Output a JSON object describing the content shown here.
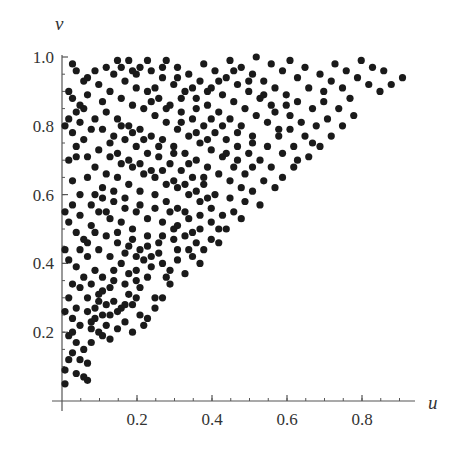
{
  "chart_data": {
    "type": "scatter",
    "title": "",
    "xlabel": "u",
    "ylabel": "v",
    "xlim": [
      0,
      0.95
    ],
    "ylim": [
      0,
      1.0
    ],
    "x_ticks": [
      "0.2",
      "0.4",
      "0.6",
      "0.8"
    ],
    "x_tick_values": [
      0.2,
      0.4,
      0.6,
      0.8
    ],
    "y_ticks": [
      "0.2",
      "0.4",
      "0.6",
      "0.8",
      "1.0"
    ],
    "y_tick_values": [
      0.2,
      0.4,
      0.6,
      0.8,
      1.0
    ],
    "minor_tick_step": 0.05,
    "grid": false,
    "legend": null,
    "marker": {
      "shape": "circle",
      "color": "#1a1a1a",
      "radius_px": 3.6
    },
    "axis_color": "#555555",
    "note": "Points lie in triangular region u <= v <= 1; coordinates estimated from pixels",
    "points": [
      [
        0.02,
        0.98
      ],
      [
        0.03,
        0.96
      ],
      [
        0.01,
        0.9
      ],
      [
        0.02,
        0.88
      ],
      [
        0.05,
        0.93
      ],
      [
        0.04,
        0.86
      ],
      [
        0.05,
        0.85
      ],
      [
        0.03,
        0.84
      ],
      [
        0.06,
        0.94
      ],
      [
        0.01,
        0.82
      ],
      [
        0.02,
        0.78
      ],
      [
        0.0,
        0.8
      ],
      [
        0.05,
        0.76
      ],
      [
        0.03,
        0.71
      ],
      [
        0.01,
        0.7
      ],
      [
        0.02,
        0.64
      ],
      [
        0.0,
        0.55
      ],
      [
        0.02,
        0.57
      ],
      [
        0.04,
        0.54
      ],
      [
        0.01,
        0.52
      ],
      [
        0.03,
        0.49
      ],
      [
        0.05,
        0.47
      ],
      [
        0.0,
        0.44
      ],
      [
        0.01,
        0.41
      ],
      [
        0.03,
        0.39
      ],
      [
        0.05,
        0.36
      ],
      [
        0.02,
        0.34
      ],
      [
        0.04,
        0.33
      ],
      [
        0.01,
        0.3
      ],
      [
        0.03,
        0.27
      ],
      [
        0.0,
        0.26
      ],
      [
        0.02,
        0.24
      ],
      [
        0.04,
        0.22
      ],
      [
        0.01,
        0.19
      ],
      [
        0.03,
        0.17
      ],
      [
        0.02,
        0.14
      ],
      [
        0.01,
        0.12
      ],
      [
        0.0,
        0.09
      ],
      [
        0.03,
        0.08
      ],
      [
        0.0,
        0.05
      ],
      [
        0.05,
        0.07
      ],
      [
        0.06,
        0.06
      ],
      [
        0.06,
        0.11
      ],
      [
        0.05,
        0.15
      ],
      [
        0.07,
        0.17
      ],
      [
        0.09,
        0.2
      ],
      [
        0.07,
        0.23
      ],
      [
        0.1,
        0.25
      ],
      [
        0.08,
        0.27
      ],
      [
        0.06,
        0.3
      ],
      [
        0.09,
        0.31
      ],
      [
        0.07,
        0.34
      ],
      [
        0.1,
        0.36
      ],
      [
        0.12,
        0.33
      ],
      [
        0.13,
        0.29
      ],
      [
        0.15,
        0.27
      ],
      [
        0.11,
        0.22
      ],
      [
        0.14,
        0.21
      ],
      [
        0.12,
        0.18
      ],
      [
        0.16,
        0.23
      ],
      [
        0.18,
        0.2
      ],
      [
        0.2,
        0.25
      ],
      [
        0.22,
        0.24
      ],
      [
        0.18,
        0.28
      ],
      [
        0.17,
        0.31
      ],
      [
        0.2,
        0.33
      ],
      [
        0.24,
        0.3
      ],
      [
        0.22,
        0.36
      ],
      [
        0.19,
        0.38
      ],
      [
        0.15,
        0.4
      ],
      [
        0.12,
        0.42
      ],
      [
        0.09,
        0.44
      ],
      [
        0.06,
        0.46
      ],
      [
        0.08,
        0.49
      ],
      [
        0.11,
        0.48
      ],
      [
        0.14,
        0.46
      ],
      [
        0.17,
        0.45
      ],
      [
        0.2,
        0.44
      ],
      [
        0.23,
        0.42
      ],
      [
        0.26,
        0.4
      ],
      [
        0.28,
        0.38
      ],
      [
        0.25,
        0.46
      ],
      [
        0.22,
        0.48
      ],
      [
        0.18,
        0.5
      ],
      [
        0.15,
        0.52
      ],
      [
        0.12,
        0.53
      ],
      [
        0.09,
        0.55
      ],
      [
        0.07,
        0.57
      ],
      [
        0.1,
        0.59
      ],
      [
        0.13,
        0.58
      ],
      [
        0.16,
        0.56
      ],
      [
        0.19,
        0.55
      ],
      [
        0.22,
        0.53
      ],
      [
        0.26,
        0.52
      ],
      [
        0.29,
        0.5
      ],
      [
        0.32,
        0.48
      ],
      [
        0.35,
        0.46
      ],
      [
        0.3,
        0.44
      ],
      [
        0.34,
        0.42
      ],
      [
        0.37,
        0.44
      ],
      [
        0.39,
        0.47
      ],
      [
        0.36,
        0.5
      ],
      [
        0.33,
        0.53
      ],
      [
        0.3,
        0.56
      ],
      [
        0.27,
        0.58
      ],
      [
        0.24,
        0.6
      ],
      [
        0.2,
        0.61
      ],
      [
        0.17,
        0.63
      ],
      [
        0.14,
        0.65
      ],
      [
        0.11,
        0.66
      ],
      [
        0.08,
        0.68
      ],
      [
        0.06,
        0.71
      ],
      [
        0.09,
        0.73
      ],
      [
        0.12,
        0.71
      ],
      [
        0.15,
        0.69
      ],
      [
        0.18,
        0.68
      ],
      [
        0.21,
        0.66
      ],
      [
        0.24,
        0.65
      ],
      [
        0.27,
        0.63
      ],
      [
        0.3,
        0.62
      ],
      [
        0.33,
        0.6
      ],
      [
        0.36,
        0.58
      ],
      [
        0.39,
        0.56
      ],
      [
        0.42,
        0.54
      ],
      [
        0.4,
        0.6
      ],
      [
        0.37,
        0.63
      ],
      [
        0.34,
        0.65
      ],
      [
        0.31,
        0.67
      ],
      [
        0.28,
        0.69
      ],
      [
        0.25,
        0.71
      ],
      [
        0.22,
        0.72
      ],
      [
        0.19,
        0.74
      ],
      [
        0.16,
        0.76
      ],
      [
        0.13,
        0.77
      ],
      [
        0.1,
        0.79
      ],
      [
        0.08,
        0.82
      ],
      [
        0.11,
        0.84
      ],
      [
        0.14,
        0.82
      ],
      [
        0.17,
        0.8
      ],
      [
        0.2,
        0.79
      ],
      [
        0.23,
        0.77
      ],
      [
        0.26,
        0.76
      ],
      [
        0.29,
        0.74
      ],
      [
        0.32,
        0.72
      ],
      [
        0.35,
        0.7
      ],
      [
        0.38,
        0.68
      ],
      [
        0.41,
        0.66
      ],
      [
        0.44,
        0.64
      ],
      [
        0.47,
        0.62
      ],
      [
        0.45,
        0.68
      ],
      [
        0.42,
        0.71
      ],
      [
        0.39,
        0.73
      ],
      [
        0.36,
        0.75
      ],
      [
        0.33,
        0.77
      ],
      [
        0.3,
        0.79
      ],
      [
        0.27,
        0.81
      ],
      [
        0.24,
        0.83
      ],
      [
        0.21,
        0.85
      ],
      [
        0.18,
        0.86
      ],
      [
        0.15,
        0.88
      ],
      [
        0.12,
        0.9
      ],
      [
        0.09,
        0.92
      ],
      [
        0.13,
        0.95
      ],
      [
        0.16,
        0.93
      ],
      [
        0.19,
        0.91
      ],
      [
        0.22,
        0.9
      ],
      [
        0.25,
        0.88
      ],
      [
        0.28,
        0.86
      ],
      [
        0.31,
        0.84
      ],
      [
        0.34,
        0.82
      ],
      [
        0.37,
        0.8
      ],
      [
        0.4,
        0.78
      ],
      [
        0.43,
        0.76
      ],
      [
        0.46,
        0.74
      ],
      [
        0.49,
        0.72
      ],
      [
        0.52,
        0.7
      ],
      [
        0.5,
        0.77
      ],
      [
        0.47,
        0.8
      ],
      [
        0.44,
        0.82
      ],
      [
        0.41,
        0.84
      ],
      [
        0.38,
        0.86
      ],
      [
        0.35,
        0.88
      ],
      [
        0.32,
        0.9
      ],
      [
        0.29,
        0.92
      ],
      [
        0.26,
        0.94
      ],
      [
        0.23,
        0.96
      ],
      [
        0.2,
        0.97
      ],
      [
        0.17,
        0.99
      ],
      [
        0.14,
        0.99
      ],
      [
        0.27,
        0.99
      ],
      [
        0.3,
        0.97
      ],
      [
        0.33,
        0.95
      ],
      [
        0.36,
        0.93
      ],
      [
        0.39,
        0.91
      ],
      [
        0.42,
        0.89
      ],
      [
        0.45,
        0.87
      ],
      [
        0.48,
        0.85
      ],
      [
        0.51,
        0.83
      ],
      [
        0.54,
        0.81
      ],
      [
        0.57,
        0.79
      ],
      [
        0.55,
        0.86
      ],
      [
        0.52,
        0.88
      ],
      [
        0.49,
        0.9
      ],
      [
        0.46,
        0.92
      ],
      [
        0.43,
        0.94
      ],
      [
        0.4,
        0.96
      ],
      [
        0.37,
        0.98
      ],
      [
        0.44,
        0.99
      ],
      [
        0.47,
        0.97
      ],
      [
        0.5,
        0.95
      ],
      [
        0.53,
        0.93
      ],
      [
        0.56,
        0.91
      ],
      [
        0.59,
        0.89
      ],
      [
        0.62,
        0.87
      ],
      [
        0.6,
        0.83
      ],
      [
        0.63,
        0.81
      ],
      [
        0.66,
        0.85
      ],
      [
        0.69,
        0.87
      ],
      [
        0.65,
        0.91
      ],
      [
        0.62,
        0.94
      ],
      [
        0.58,
        0.96
      ],
      [
        0.55,
        0.98
      ],
      [
        0.51,
        1.0
      ],
      [
        0.6,
        0.99
      ],
      [
        0.64,
        0.97
      ],
      [
        0.68,
        0.95
      ],
      [
        0.71,
        0.93
      ],
      [
        0.74,
        0.91
      ],
      [
        0.72,
        0.98
      ],
      [
        0.75,
        0.96
      ],
      [
        0.78,
        0.94
      ],
      [
        0.81,
        0.92
      ],
      [
        0.84,
        0.9
      ],
      [
        0.87,
        0.92
      ],
      [
        0.9,
        0.94
      ],
      [
        0.82,
        0.97
      ],
      [
        0.79,
        0.99
      ],
      [
        0.85,
        0.96
      ],
      [
        0.76,
        0.88
      ],
      [
        0.73,
        0.85
      ],
      [
        0.7,
        0.82
      ],
      [
        0.67,
        0.8
      ],
      [
        0.64,
        0.77
      ],
      [
        0.61,
        0.74
      ],
      [
        0.58,
        0.72
      ],
      [
        0.55,
        0.68
      ],
      [
        0.53,
        0.64
      ],
      [
        0.5,
        0.61
      ],
      [
        0.48,
        0.58
      ],
      [
        0.45,
        0.55
      ],
      [
        0.43,
        0.5
      ],
      [
        0.41,
        0.46
      ],
      [
        0.44,
        0.59
      ],
      [
        0.48,
        0.66
      ],
      [
        0.58,
        0.65
      ],
      [
        0.61,
        0.68
      ],
      [
        0.65,
        0.71
      ],
      [
        0.68,
        0.74
      ],
      [
        0.71,
        0.77
      ],
      [
        0.74,
        0.8
      ],
      [
        0.77,
        0.83
      ],
      [
        0.69,
        0.9
      ],
      [
        0.66,
        0.75
      ],
      [
        0.62,
        0.7
      ],
      [
        0.56,
        0.62
      ],
      [
        0.52,
        0.57
      ],
      [
        0.47,
        0.53
      ],
      [
        0.41,
        0.5
      ],
      [
        0.36,
        0.4
      ],
      [
        0.32,
        0.37
      ],
      [
        0.28,
        0.34
      ],
      [
        0.26,
        0.3
      ],
      [
        0.24,
        0.27
      ],
      [
        0.21,
        0.22
      ],
      [
        0.33,
        0.44
      ],
      [
        0.29,
        0.47
      ],
      [
        0.25,
        0.43
      ],
      [
        0.21,
        0.41
      ],
      [
        0.17,
        0.37
      ],
      [
        0.13,
        0.35
      ],
      [
        0.1,
        0.32
      ],
      [
        0.08,
        0.38
      ],
      [
        0.06,
        0.42
      ],
      [
        0.04,
        0.44
      ],
      [
        0.07,
        0.51
      ],
      [
        0.04,
        0.6
      ],
      [
        0.06,
        0.65
      ],
      [
        0.03,
        0.74
      ],
      [
        0.07,
        0.79
      ],
      [
        0.04,
        0.81
      ],
      [
        0.1,
        0.87
      ],
      [
        0.06,
        0.89
      ],
      [
        0.08,
        0.96
      ],
      [
        0.11,
        0.97
      ],
      [
        0.19,
        0.95
      ],
      [
        0.24,
        0.91
      ],
      [
        0.31,
        0.88
      ],
      [
        0.35,
        0.85
      ],
      [
        0.39,
        0.82
      ],
      [
        0.42,
        0.8
      ],
      [
        0.46,
        0.78
      ],
      [
        0.5,
        0.75
      ],
      [
        0.54,
        0.74
      ],
      [
        0.57,
        0.77
      ],
      [
        0.6,
        0.79
      ],
      [
        0.56,
        0.84
      ],
      [
        0.59,
        0.86
      ],
      [
        0.53,
        0.89
      ],
      [
        0.49,
        0.93
      ],
      [
        0.45,
        0.96
      ],
      [
        0.41,
        0.93
      ],
      [
        0.38,
        0.9
      ],
      [
        0.34,
        0.91
      ],
      [
        0.3,
        0.94
      ],
      [
        0.26,
        0.97
      ],
      [
        0.22,
        0.99
      ],
      [
        0.18,
        0.96
      ],
      [
        0.15,
        0.97
      ],
      [
        0.23,
        0.87
      ],
      [
        0.27,
        0.85
      ],
      [
        0.31,
        0.81
      ],
      [
        0.35,
        0.78
      ],
      [
        0.38,
        0.76
      ],
      [
        0.43,
        0.72
      ],
      [
        0.46,
        0.7
      ],
      [
        0.5,
        0.68
      ],
      [
        0.37,
        0.65
      ],
      [
        0.33,
        0.69
      ],
      [
        0.29,
        0.72
      ],
      [
        0.25,
        0.74
      ],
      [
        0.21,
        0.76
      ],
      [
        0.18,
        0.78
      ],
      [
        0.15,
        0.8
      ],
      [
        0.12,
        0.75
      ],
      [
        0.14,
        0.72
      ],
      [
        0.17,
        0.7
      ],
      [
        0.2,
        0.69
      ],
      [
        0.23,
        0.67
      ],
      [
        0.26,
        0.67
      ],
      [
        0.29,
        0.64
      ],
      [
        0.32,
        0.63
      ],
      [
        0.35,
        0.61
      ],
      [
        0.38,
        0.59
      ],
      [
        0.39,
        0.52
      ],
      [
        0.36,
        0.54
      ],
      [
        0.32,
        0.55
      ],
      [
        0.28,
        0.55
      ],
      [
        0.24,
        0.56
      ],
      [
        0.2,
        0.57
      ],
      [
        0.16,
        0.59
      ],
      [
        0.13,
        0.61
      ],
      [
        0.1,
        0.62
      ],
      [
        0.08,
        0.6
      ],
      [
        0.11,
        0.55
      ],
      [
        0.14,
        0.49
      ],
      [
        0.18,
        0.47
      ],
      [
        0.22,
        0.45
      ],
      [
        0.26,
        0.48
      ],
      [
        0.3,
        0.51
      ],
      [
        0.34,
        0.49
      ],
      [
        0.19,
        0.42
      ],
      [
        0.16,
        0.43
      ],
      [
        0.13,
        0.38
      ],
      [
        0.16,
        0.34
      ],
      [
        0.19,
        0.35
      ],
      [
        0.23,
        0.39
      ],
      [
        0.27,
        0.36
      ],
      [
        0.3,
        0.41
      ],
      [
        0.11,
        0.28
      ],
      [
        0.14,
        0.26
      ],
      [
        0.08,
        0.24
      ],
      [
        0.1,
        0.19
      ],
      [
        0.07,
        0.21
      ],
      [
        0.06,
        0.26
      ],
      [
        0.09,
        0.29
      ],
      [
        0.12,
        0.25
      ],
      [
        0.16,
        0.28
      ],
      [
        0.19,
        0.3
      ],
      [
        0.04,
        0.12
      ],
      [
        0.02,
        0.2
      ]
    ]
  },
  "axes": {
    "x_label": "u",
    "y_label": "v",
    "x_ticks": [
      "0.2",
      "0.4",
      "0.6",
      "0.8"
    ],
    "y_ticks": [
      "0.2",
      "0.4",
      "0.6",
      "0.8",
      "1.0"
    ]
  }
}
